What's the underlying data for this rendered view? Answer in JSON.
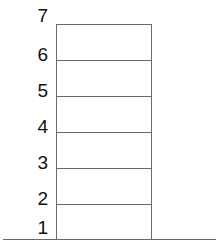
{
  "diagram": {
    "type": "stacked-levels",
    "levels": [
      {
        "label": "7",
        "line_y": 24
      },
      {
        "label": "6",
        "line_y": 60
      },
      {
        "label": "5",
        "line_y": 96
      },
      {
        "label": "4",
        "line_y": 132
      },
      {
        "label": "3",
        "line_y": 168
      },
      {
        "label": "2",
        "line_y": 204
      },
      {
        "label": "1",
        "line_y": 239
      }
    ],
    "line_color": "#6a6a6a",
    "label_color": "#111111"
  }
}
